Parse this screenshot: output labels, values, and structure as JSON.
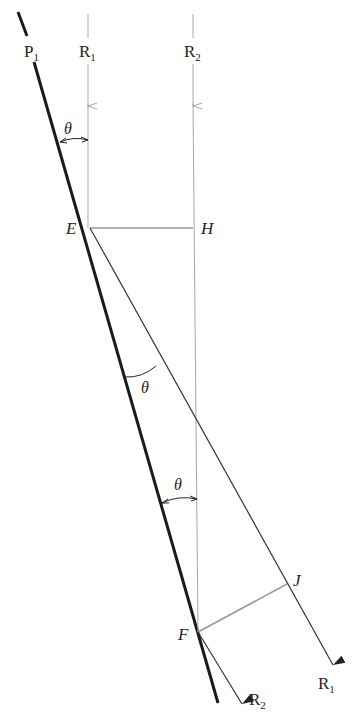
{
  "diagram": {
    "type": "geometry-ray-reflection",
    "labels": {
      "plane": "P",
      "plane_sub": "1",
      "ray1": "R",
      "ray1_sub": "1",
      "ray2": "R",
      "ray2_sub": "2",
      "ray1_out": "R",
      "ray1_out_sub": "1",
      "ray2_out": "R",
      "ray2_out_sub": "2",
      "point_e": "E",
      "point_h": "H",
      "point_f": "F",
      "point_j": "J",
      "angle_top": "θ",
      "angle_mid": "θ",
      "angle_low": "θ"
    },
    "colors": {
      "plane": "#1a1a1a",
      "ray_in": "#a8a8a8",
      "ray_out": "#333333",
      "construction": "#9a9a9a"
    }
  }
}
